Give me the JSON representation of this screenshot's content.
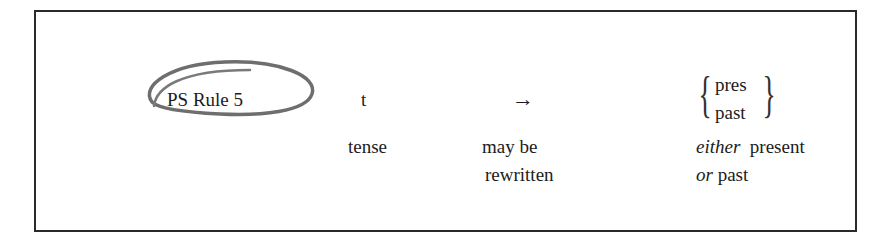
{
  "rule": {
    "label": "PS Rule 5",
    "symbol": "t",
    "arrow": "→",
    "options": [
      "pres",
      "past"
    ]
  },
  "gloss": {
    "symbol": "tense",
    "arrow_line1": "may be",
    "arrow_line2": "rewritten",
    "options_either": "either",
    "options_present": "present",
    "options_or": "or",
    "options_past": "past"
  },
  "annotation": {
    "type": "hand-drawn circle around rule label",
    "color": "#6e6e6e"
  }
}
